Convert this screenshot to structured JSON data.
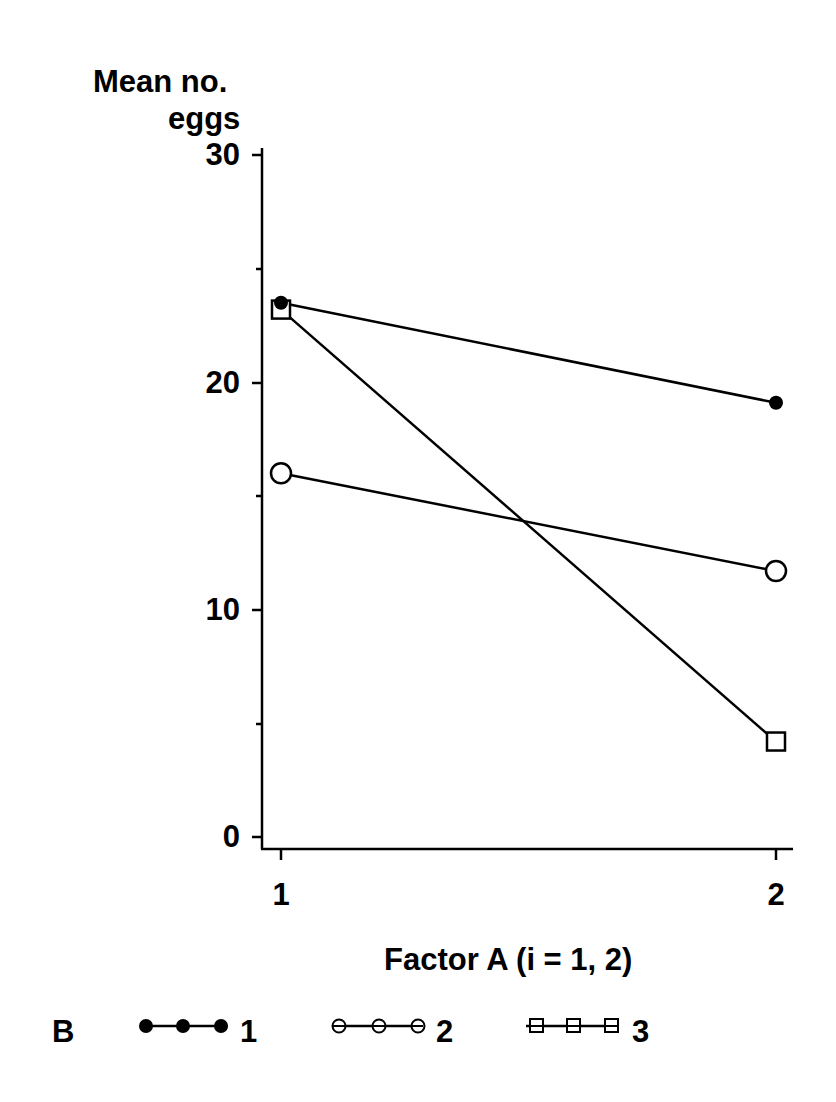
{
  "chart_data": {
    "type": "line",
    "title": "",
    "ylabel_line1": "Mean no.",
    "ylabel_line2": "eggs",
    "xlabel": "Factor  A  (i = 1,  2)",
    "x": [
      1,
      2
    ],
    "x_tick_labels": [
      "1",
      "2"
    ],
    "y_tick_labels": [
      "0",
      "10",
      "20",
      "30"
    ],
    "ylim": [
      0,
      30
    ],
    "y_minor_ticks": [
      5,
      15,
      25
    ],
    "grid": false,
    "legend_title": "B",
    "legend_position": "bottom",
    "series": [
      {
        "name": "1",
        "marker": "filled-circle",
        "values": [
          23.5,
          19.1
        ]
      },
      {
        "name": "2",
        "marker": "open-circle",
        "values": [
          16.0,
          11.7
        ]
      },
      {
        "name": "3",
        "marker": "open-square",
        "values": [
          23.2,
          4.2
        ]
      }
    ]
  }
}
